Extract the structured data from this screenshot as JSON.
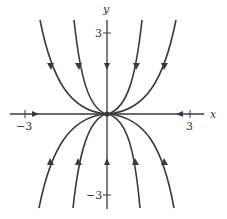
{
  "diagram": {
    "type": "phase-portrait",
    "axes": {
      "x_label": "x",
      "y_label": "y",
      "x_ticks": [
        {
          "value": -3,
          "label": "−3"
        },
        {
          "value": 3,
          "label": "3"
        }
      ],
      "y_ticks": [
        {
          "value": 3,
          "label": "3"
        },
        {
          "value": -3,
          "label": "−3"
        }
      ]
    },
    "equilibrium": {
      "x": 0,
      "y": 0,
      "label": "origin"
    },
    "trajectories": {
      "upper_half": {
        "count": 5,
        "direction": "toward origin (downward arrows)"
      },
      "lower_half": {
        "count": 5,
        "direction": "toward origin (upward arrows)"
      },
      "x_axis": {
        "direction": "toward origin from both sides"
      }
    },
    "colors": {
      "stroke": "#3a3a3a",
      "background": "#ffffff"
    }
  }
}
